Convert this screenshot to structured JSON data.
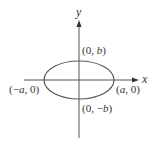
{
  "diagram": {
    "type": "ellipse-on-axes",
    "axes": {
      "x_label": "x",
      "y_label": "y"
    },
    "points": {
      "top": {
        "label_pre": "(0, ",
        "var": "b",
        "label_post": ")"
      },
      "bottom": {
        "label_pre": "(0, −",
        "var": "b",
        "label_post": ")"
      },
      "left": {
        "label_pre": "(−",
        "var": "a",
        "label_post": ", 0)"
      },
      "right": {
        "label_pre": "(",
        "var": "a",
        "label_post": ", 0)"
      }
    },
    "colors": {
      "stroke": "#555555",
      "text": "#333333",
      "background": "#ffffff"
    }
  }
}
